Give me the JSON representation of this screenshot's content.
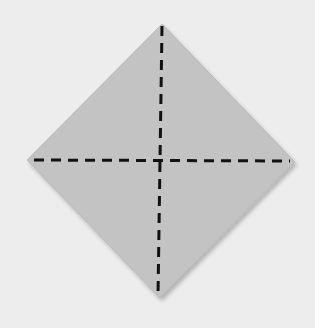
{
  "diagram": {
    "colors": {
      "background": "#ededed",
      "paper": "#c3c3c3",
      "paper_edge_shadow": "#a9a9a9",
      "crease": "#111111"
    },
    "paper": {
      "shape": "diamond",
      "vertices": {
        "top": [
          162,
          24
        ],
        "right": [
          295,
          162
        ],
        "bottom": [
          160,
          298
        ],
        "left": [
          27,
          160
        ]
      }
    },
    "creases": [
      {
        "name": "vertical-crease",
        "type": "valley-fold-dashed",
        "from": [
          162,
          26
        ],
        "to": [
          158,
          296
        ]
      },
      {
        "name": "horizontal-crease",
        "type": "valley-fold-dashed",
        "from": [
          34,
          160
        ],
        "to": [
          290,
          161
        ]
      }
    ],
    "dash_pattern": "10 7"
  }
}
